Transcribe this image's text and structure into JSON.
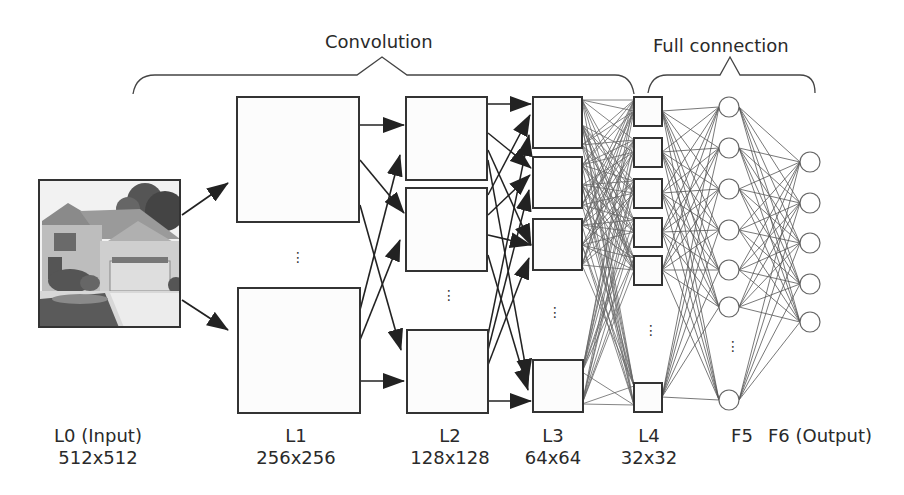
{
  "groups": {
    "convolution": {
      "label": "Convolution"
    },
    "full_connection": {
      "label": "Full connection"
    }
  },
  "layers": [
    {
      "id": "L0",
      "name": "L0 (Input)",
      "size": "512x512",
      "type": "image"
    },
    {
      "id": "L1",
      "name": "L1",
      "size": "256x256",
      "type": "feature-maps",
      "visible_maps": 2
    },
    {
      "id": "L2",
      "name": "L2",
      "size": "128x128",
      "type": "feature-maps",
      "visible_maps": 3
    },
    {
      "id": "L3",
      "name": "L3",
      "size": "64x64",
      "type": "feature-maps",
      "visible_maps": 4
    },
    {
      "id": "L4",
      "name": "L4",
      "size": "32x32",
      "type": "feature-maps",
      "visible_maps": 6
    },
    {
      "id": "F5",
      "name": "F5",
      "size": "",
      "type": "fully-connected",
      "visible_nodes": 7
    },
    {
      "id": "F6",
      "name": "F6 (Output)",
      "size": "",
      "type": "output",
      "visible_nodes": 5
    }
  ],
  "ellipsis": "⋮",
  "colors": {
    "stroke": "#333333",
    "thin_stroke": "#555555",
    "text": "#2a2a2a"
  }
}
